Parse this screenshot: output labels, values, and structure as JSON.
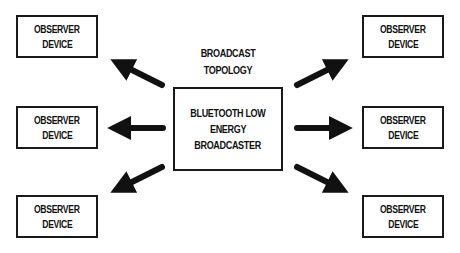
{
  "diagram": {
    "title_lines": [
      "BROADCAST",
      "TOPOLOGY"
    ],
    "broadcaster": {
      "lines": [
        "BLUETOOTH LOW",
        "ENERGY",
        "BROADCASTER"
      ]
    },
    "observers": [
      {
        "position": "top-left",
        "lines": [
          "OBSERVER",
          "DEVICE"
        ]
      },
      {
        "position": "middle-left",
        "lines": [
          "OBSERVER",
          "DEVICE"
        ]
      },
      {
        "position": "bottom-left",
        "lines": [
          "OBSERVER",
          "DEVICE"
        ]
      },
      {
        "position": "top-right",
        "lines": [
          "OBSERVER",
          "DEVICE"
        ]
      },
      {
        "position": "middle-right",
        "lines": [
          "OBSERVER",
          "DEVICE"
        ]
      },
      {
        "position": "bottom-right",
        "lines": [
          "OBSERVER",
          "DEVICE"
        ]
      }
    ],
    "arrows": [
      {
        "from": "broadcaster",
        "to": "top-left"
      },
      {
        "from": "broadcaster",
        "to": "middle-left"
      },
      {
        "from": "broadcaster",
        "to": "bottom-left"
      },
      {
        "from": "broadcaster",
        "to": "top-right"
      },
      {
        "from": "broadcaster",
        "to": "middle-right"
      },
      {
        "from": "broadcaster",
        "to": "bottom-right"
      }
    ],
    "colors": {
      "stroke": "#1a1a1a",
      "background": "#ffffff",
      "text": "#111111"
    }
  }
}
